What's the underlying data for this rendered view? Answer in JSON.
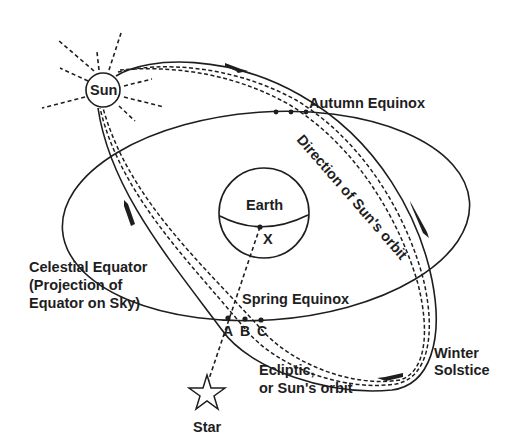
{
  "diagram": {
    "labels": {
      "sun": "Sun",
      "earth": "Earth",
      "x_point": "X",
      "autumn_equinox": "Autumn Equinox",
      "direction": "Direction of Sun's orbit",
      "celestial_equator_line1": "Celestial Equator",
      "celestial_equator_line2": "(Projection of",
      "celestial_equator_line3": "Equator on Sky)",
      "spring_equinox": "Spring Equinox",
      "point_a": "A",
      "point_b": "B",
      "point_c": "C",
      "ecliptic_line1": "Ecliptic,",
      "ecliptic_line2": "or Sun's orbit",
      "winter_solstice_line1": "Winter",
      "winter_solstice_line2": "Solstice",
      "star": "Star"
    },
    "colors": {
      "ink": "#1e1e1e",
      "background": "#ffffff"
    }
  }
}
